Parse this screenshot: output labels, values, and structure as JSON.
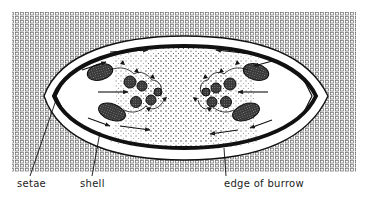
{
  "figure": {
    "labels": {
      "setae": "setae",
      "shell": "shell",
      "edge_of_burrow": "edge of burrow"
    },
    "colors": {
      "ink": "#1a1a1a",
      "background": "#ffffff",
      "sediment_pattern": "#555555",
      "stipple": "#333333"
    }
  }
}
